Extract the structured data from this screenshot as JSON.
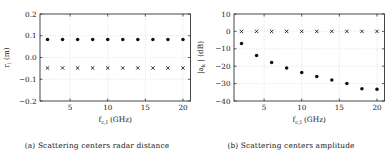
{
  "figure": {
    "subfigures": [
      {
        "caption": "(a) Scattering centers radar distance",
        "panel_label": "(a)"
      },
      {
        "caption": "(b) Scattering centers amplitude",
        "panel_label": "(b)"
      }
    ]
  },
  "chart_data": [
    {
      "type": "scatter",
      "title": "",
      "panel": "(a)",
      "caption": "(a) Scattering centers radar distance",
      "xlabel": "f_{c,l} (GHz)",
      "xlabel_base": "f",
      "xlabel_sub": "c,l",
      "xlabel_unit": "(GHz)",
      "ylabel": "r_i (m)",
      "ylabel_base": "r",
      "ylabel_sub": "i",
      "ylabel_unit": "(m)",
      "xlim": [
        1,
        21
      ],
      "ylim": [
        -0.2,
        0.2
      ],
      "xticks": [
        5,
        10,
        15,
        20
      ],
      "xtick_labels": [
        "5",
        "10",
        "15",
        "20"
      ],
      "yticks": [
        -0.2,
        -0.1,
        0.0,
        0.1,
        0.2
      ],
      "ytick_labels": [
        "−0.2",
        "−0.1",
        "0.0",
        "0.1",
        "0.2"
      ],
      "grid": true,
      "legend": "none",
      "x": [
        2,
        4,
        6,
        8,
        10,
        12,
        14,
        16,
        18,
        20
      ],
      "series": [
        {
          "name": "scatterer 1",
          "marker": "dot",
          "values": [
            0.083,
            0.083,
            0.083,
            0.083,
            0.083,
            0.083,
            0.083,
            0.083,
            0.083,
            0.083
          ]
        },
        {
          "name": "scatterer 2",
          "marker": "cross",
          "values": [
            -0.048,
            -0.048,
            -0.048,
            -0.048,
            -0.048,
            -0.048,
            -0.048,
            -0.048,
            -0.048,
            -0.048
          ]
        }
      ]
    },
    {
      "type": "scatter",
      "title": "",
      "panel": "(b)",
      "caption": "(b) Scattering centers amplitude",
      "xlabel": "f_{c,l} (GHz)",
      "xlabel_base": "f",
      "xlabel_sub": "c,l",
      "xlabel_unit": "(GHz)",
      "ylabel": "|a_k| (dB)",
      "ylabel_base": "|a",
      "ylabel_sub": "k",
      "ylabel_unit": "| (dB)",
      "xlim": [
        1,
        21
      ],
      "ylim": [
        -40,
        10
      ],
      "xticks": [
        5,
        10,
        15,
        20
      ],
      "xtick_labels": [
        "5",
        "10",
        "15",
        "20"
      ],
      "yticks": [
        -40,
        -30,
        -20,
        -10,
        0,
        10
      ],
      "ytick_labels": [
        "−40",
        "−30",
        "−20",
        "−10",
        "0",
        "10"
      ],
      "grid": true,
      "legend": "none",
      "x": [
        2,
        4,
        6,
        8,
        10,
        12,
        14,
        16,
        18,
        20
      ],
      "series": [
        {
          "name": "scatterer 1",
          "marker": "cross",
          "values": [
            0,
            0,
            0,
            0,
            0,
            0,
            0,
            0,
            0,
            0
          ]
        },
        {
          "name": "scatterer 2",
          "marker": "dot",
          "values": [
            -7,
            -13.8,
            -17.9,
            -21,
            -23.6,
            -25.9,
            -27.9,
            -29.9,
            -33,
            -33.3
          ]
        }
      ]
    }
  ]
}
